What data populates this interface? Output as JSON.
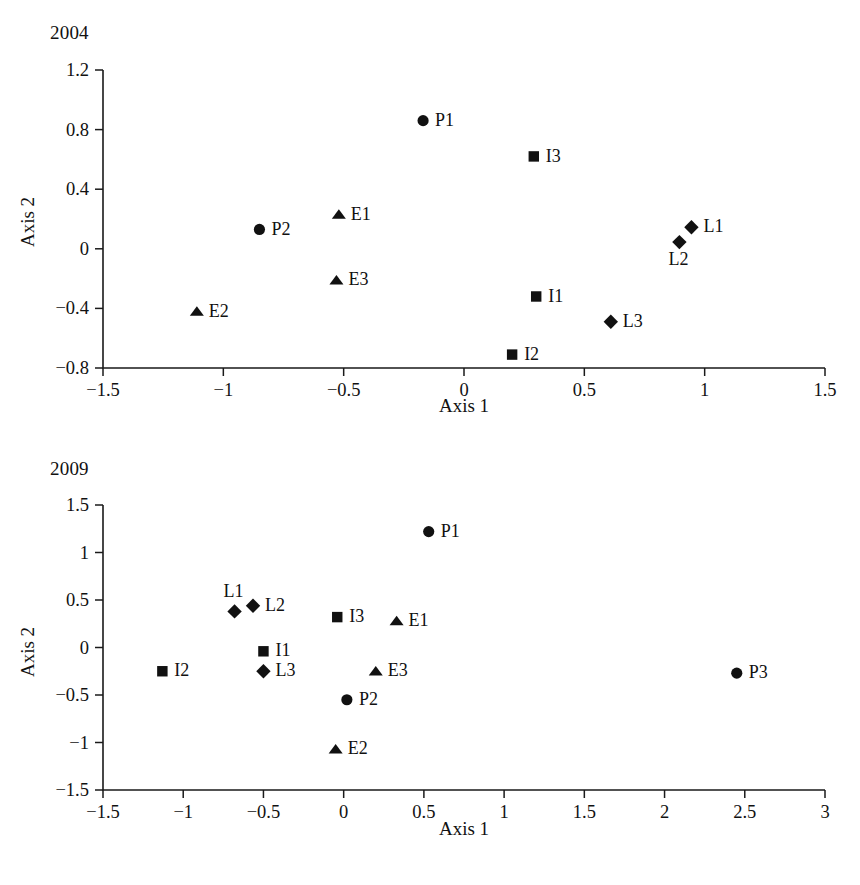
{
  "figure": {
    "background": "#ffffff",
    "marker_color": "#111111",
    "axis_color": "#1a1a1a"
  },
  "panels": [
    {
      "id": "panel-2004",
      "title": "2004",
      "xlabel": "Axis 1",
      "ylabel": "Axis 2"
    },
    {
      "id": "panel-2009",
      "title": "2009",
      "xlabel": "Axis 1",
      "ylabel": "Axis 2"
    }
  ],
  "chart_data": [
    {
      "type": "scatter",
      "title": "2004",
      "xlabel": "Axis 1",
      "ylabel": "Axis 2",
      "xlim": [
        -1.5,
        1.5
      ],
      "ylim": [
        -0.8,
        1.2
      ],
      "xticks": [
        -1.5,
        -1,
        -0.5,
        0,
        0.5,
        1,
        1.5
      ],
      "xticklabels": [
        "−1.5",
        "−1",
        "−0.5",
        "0",
        "0.5",
        "1",
        "1.5"
      ],
      "yticks": [
        -0.8,
        -0.4,
        0,
        0.4,
        0.8,
        1.2
      ],
      "yticklabels": [
        "−0.8",
        "−0.4",
        "0",
        "0.4",
        "0.8",
        "1.2"
      ],
      "grid": false,
      "legend": "none",
      "series": [
        {
          "name": "P",
          "marker": "circle",
          "points": [
            {
              "label": "P1",
              "x": -0.17,
              "y": 0.86,
              "label_pos": "right"
            },
            {
              "label": "P2",
              "x": -0.85,
              "y": 0.13,
              "label_pos": "right"
            }
          ]
        },
        {
          "name": "E",
          "marker": "triangle",
          "points": [
            {
              "label": "E1",
              "x": -0.52,
              "y": 0.23,
              "label_pos": "right"
            },
            {
              "label": "E2",
              "x": -1.11,
              "y": -0.42,
              "label_pos": "right"
            },
            {
              "label": "E3",
              "x": -0.53,
              "y": -0.21,
              "label_pos": "right"
            }
          ]
        },
        {
          "name": "I",
          "marker": "square",
          "points": [
            {
              "label": "I1",
              "x": 0.3,
              "y": -0.32,
              "label_pos": "right"
            },
            {
              "label": "I2",
              "x": 0.2,
              "y": -0.71,
              "label_pos": "right"
            },
            {
              "label": "I3",
              "x": 0.29,
              "y": 0.62,
              "label_pos": "right"
            }
          ]
        },
        {
          "name": "L",
          "marker": "diamond",
          "points": [
            {
              "label": "L1",
              "x": 0.945,
              "y": 0.145,
              "label_pos": "right"
            },
            {
              "label": "L2",
              "x": 0.895,
              "y": 0.045,
              "label_pos": "below"
            },
            {
              "label": "L3",
              "x": 0.61,
              "y": -0.49,
              "label_pos": "right"
            }
          ]
        }
      ]
    },
    {
      "type": "scatter",
      "title": "2009",
      "xlabel": "Axis 1",
      "ylabel": "Axis 2",
      "xlim": [
        -1.5,
        3
      ],
      "ylim": [
        -1.5,
        1.5
      ],
      "xticks": [
        -1.5,
        -1,
        -0.5,
        0,
        0.5,
        1,
        1.5,
        2,
        2.5,
        3
      ],
      "xticklabels": [
        "−1.5",
        "−1",
        "−0.5",
        "0",
        "0.5",
        "1",
        "1.5",
        "2",
        "2.5",
        "3"
      ],
      "yticks": [
        -1.5,
        -1,
        -0.5,
        0,
        0.5,
        1,
        1.5
      ],
      "yticklabels": [
        "−1.5",
        "−1",
        "−0.5",
        "0",
        "0.5",
        "1",
        "1.5"
      ],
      "grid": false,
      "legend": "none",
      "series": [
        {
          "name": "P",
          "marker": "circle",
          "points": [
            {
              "label": "P1",
              "x": 0.53,
              "y": 1.22,
              "label_pos": "right"
            },
            {
              "label": "P2",
              "x": 0.02,
              "y": -0.55,
              "label_pos": "right"
            },
            {
              "label": "P3",
              "x": 2.45,
              "y": -0.27,
              "label_pos": "right"
            }
          ]
        },
        {
          "name": "E",
          "marker": "triangle",
          "points": [
            {
              "label": "E1",
              "x": 0.33,
              "y": 0.28,
              "label_pos": "right"
            },
            {
              "label": "E2",
              "x": -0.05,
              "y": -1.07,
              "label_pos": "right"
            },
            {
              "label": "E3",
              "x": 0.2,
              "y": -0.25,
              "label_pos": "right"
            }
          ]
        },
        {
          "name": "I",
          "marker": "square",
          "points": [
            {
              "label": "I1",
              "x": -0.5,
              "y": -0.04,
              "label_pos": "right"
            },
            {
              "label": "I2",
              "x": -1.13,
              "y": -0.25,
              "label_pos": "right"
            },
            {
              "label": "I3",
              "x": -0.04,
              "y": 0.32,
              "label_pos": "right"
            }
          ]
        },
        {
          "name": "L",
          "marker": "diamond",
          "points": [
            {
              "label": "L1",
              "x": -0.68,
              "y": 0.38,
              "label_pos": "above"
            },
            {
              "label": "L2",
              "x": -0.565,
              "y": 0.44,
              "label_pos": "right"
            },
            {
              "label": "L3",
              "x": -0.5,
              "y": -0.25,
              "label_pos": "right"
            }
          ]
        }
      ]
    }
  ]
}
